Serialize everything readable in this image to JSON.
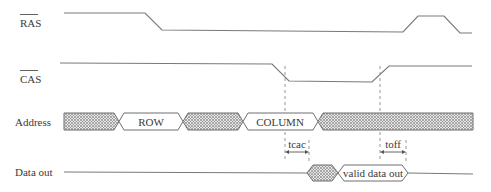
{
  "diagram": {
    "type": "timing-diagram",
    "signals": [
      {
        "name": "RAS",
        "overline": true,
        "label": "RAS"
      },
      {
        "name": "CAS",
        "overline": true,
        "label": "CAS"
      },
      {
        "name": "Address",
        "overline": false,
        "label": "Address"
      },
      {
        "name": "Data out",
        "overline": false,
        "label": "Data out"
      }
    ],
    "address_segments": [
      {
        "kind": "invalid",
        "label": ""
      },
      {
        "kind": "valid",
        "label": "ROW"
      },
      {
        "kind": "invalid",
        "label": ""
      },
      {
        "kind": "valid",
        "label": "COLUMN"
      },
      {
        "kind": "invalid",
        "label": ""
      }
    ],
    "data_segments": [
      {
        "kind": "idle",
        "label": ""
      },
      {
        "kind": "invalid",
        "label": ""
      },
      {
        "kind": "valid",
        "label": "valid data out"
      },
      {
        "kind": "idle",
        "label": ""
      }
    ],
    "timing_annotations": [
      {
        "name": "tcac",
        "label": "tcac"
      },
      {
        "name": "toff",
        "label": "toff"
      }
    ],
    "colors": {
      "line": "#7a7a7a",
      "text": "#3a3a3a",
      "hatch": "#8c8c8c"
    }
  }
}
